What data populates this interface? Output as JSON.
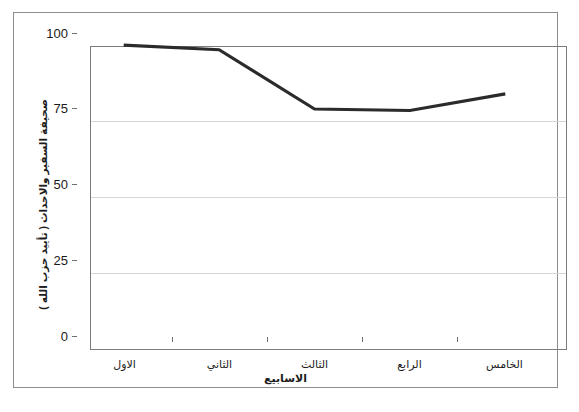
{
  "chart_data": {
    "type": "line",
    "title": "",
    "categories": [
      "الاول",
      "الثاني",
      "الثالث",
      "الرابع",
      "الخامس"
    ],
    "values": [
      96,
      94.5,
      75,
      74.5,
      80
    ],
    "series": [
      {
        "name": "صحيفة السفير والاحداث ( تأييد حزب الله )",
        "values": [
          96,
          94.5,
          75,
          74.5,
          80
        ],
        "color": "#2b2b2b"
      }
    ],
    "xlabel": "الاسابيع",
    "ylabel": "صحيفة السفير والاحداث ( تأييد حزب الله )",
    "ylim": [
      0,
      100
    ],
    "yticks": [
      0,
      25,
      50,
      75,
      100
    ],
    "ytick_labels": [
      "0",
      "25",
      "50",
      "75",
      "100"
    ],
    "grid": true,
    "grid_axis": "y",
    "legend": false,
    "legend_position": "none"
  },
  "axes": {
    "y": {
      "ticks": [
        {
          "label": "100",
          "value": 100
        },
        {
          "label": "75",
          "value": 75
        },
        {
          "label": "50",
          "value": 50
        },
        {
          "label": "25",
          "value": 25
        },
        {
          "label": "0",
          "value": 0
        }
      ],
      "title": "صحيفة السفير والاحداث ( تأييد حزب الله )"
    },
    "x": {
      "ticks": [
        {
          "label": "الاول"
        },
        {
          "label": "الثاني"
        },
        {
          "label": "الثالث"
        },
        {
          "label": "الرابع"
        },
        {
          "label": "الخامس"
        }
      ],
      "title": "الاسابيع"
    }
  },
  "style": {
    "line_color": "#2b2b2b",
    "grid_color": "#d6d6d6",
    "frame_color": "#8d8d8d",
    "plot_border_color": "#7b7b7b",
    "background": "#ffffff"
  }
}
